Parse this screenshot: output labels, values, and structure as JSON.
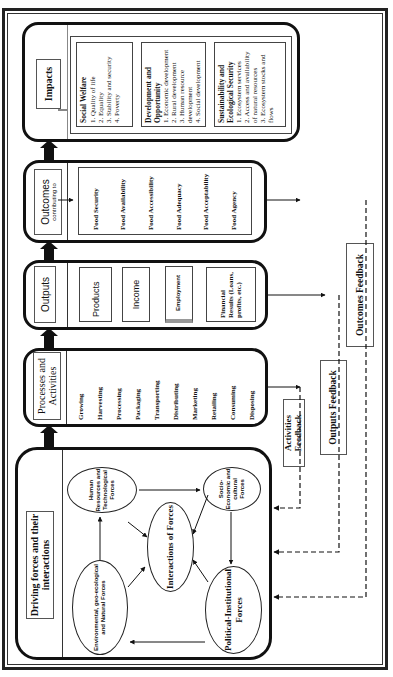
{
  "diagram": {
    "orientation": "rotated 90 degrees counter-clockwise",
    "stages": {
      "driving_forces": {
        "title": "Driving forces and their interactions",
        "forces": {
          "human": "Human Resources and Technological Forces",
          "socio": "Socio-Economic and cultural Forces",
          "interactions": "Interactions of Forces",
          "environmental": "Environmental, geo-ecological and Natural Forces",
          "political": "Political-Institutional Forces"
        }
      },
      "processes": {
        "title": "Processes and Activities",
        "items": [
          "Growing",
          "Harvesting",
          "Processing",
          "Packaging",
          "Transporting",
          "Distributing",
          "Marketing",
          "Retailing",
          "Consuming",
          "Disposing"
        ]
      },
      "outputs": {
        "title": "Outputs",
        "items": [
          "Products",
          "Income",
          "Employment",
          "Financial Results (Loans, profits, etc.)"
        ]
      },
      "outcomes": {
        "title": "Outcomes",
        "subtitle": "contributing to",
        "items": [
          "Food Security",
          "Food Availability",
          "Food Accessibility",
          "Food Adequacy",
          "Food Acceptability",
          "Food Agency"
        ]
      },
      "impacts": {
        "title": "Impacts",
        "groups": [
          {
            "heading": "Social Welfare",
            "items": [
              "1. Quality of life",
              "2. Equality",
              "3. Stability and security",
              "4. Poverty"
            ]
          },
          {
            "heading": "Development and Opportunity",
            "items": [
              "1. Economic development",
              "2. Rural development",
              "3. Human resource development",
              "4. Social development"
            ]
          },
          {
            "heading": "Sustainability and Ecological Security",
            "items": [
              "1. Ecosystem services",
              "2. Access and availability of natural resources",
              "3. Ecosystem stocks and flows"
            ]
          }
        ]
      }
    },
    "feedback": {
      "activities": "Activities Feedback",
      "outputs": "Outputs Feedback",
      "outcomes": "Outcomes Feedback"
    }
  }
}
